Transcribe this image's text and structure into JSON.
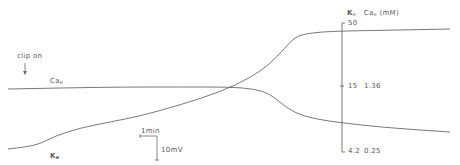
{
  "chart_data": {
    "type": "line",
    "title": "",
    "annotations": {
      "clip_on": "clip on",
      "scale_time": "1min",
      "scale_voltage": "10mV"
    },
    "axis": {
      "header_k": "K",
      "header_k_sub": "e",
      "header_ca": "Ca",
      "header_ca_sub": "e",
      "header_units": "(mM)",
      "ticks": [
        {
          "k": "50",
          "ca": ""
        },
        {
          "k": "15",
          "ca": "1.36"
        },
        {
          "k": "4.2",
          "ca": "0.25"
        }
      ]
    },
    "series": [
      {
        "name": "Ca_e",
        "label": "Ca",
        "label_sub": "e",
        "points": [
          [
            8,
            89
          ],
          [
            60,
            88
          ],
          [
            120,
            87
          ],
          [
            180,
            87
          ],
          [
            230,
            87
          ],
          [
            255,
            89
          ],
          [
            270,
            94
          ],
          [
            282,
            104
          ],
          [
            295,
            113
          ],
          [
            315,
            119
          ],
          [
            343,
            123
          ],
          [
            380,
            127
          ],
          [
            420,
            130
          ],
          [
            450,
            132
          ]
        ]
      },
      {
        "name": "K_e",
        "label": "K",
        "label_sub": "e",
        "points": [
          [
            8,
            149
          ],
          [
            25,
            147
          ],
          [
            40,
            144
          ],
          [
            55,
            136
          ],
          [
            80,
            128
          ],
          [
            110,
            122
          ],
          [
            140,
            116
          ],
          [
            180,
            105
          ],
          [
            220,
            92
          ],
          [
            250,
            78
          ],
          [
            270,
            64
          ],
          [
            285,
            48
          ],
          [
            295,
            37
          ],
          [
            305,
            34
          ],
          [
            320,
            32
          ],
          [
            343,
            31
          ],
          [
            400,
            30
          ],
          [
            450,
            29
          ]
        ]
      }
    ],
    "grid": false,
    "legend": "none (inline labels)"
  }
}
